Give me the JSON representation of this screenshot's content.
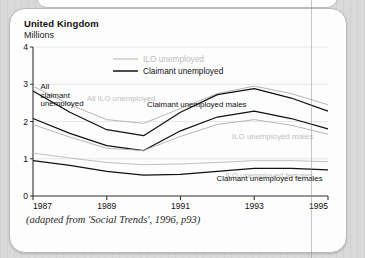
{
  "card": {
    "title": "United Kingdom",
    "units": "Millions",
    "caption": "(adapted from 'Social Trends', 1996, p93)"
  },
  "chart_data": {
    "type": "line",
    "title": "United Kingdom",
    "subtitle": "Millions",
    "xlabel": "",
    "ylabel": "Millions",
    "xlim": [
      1987,
      1995
    ],
    "ylim": [
      0,
      4
    ],
    "yticks": [
      0,
      1,
      2,
      3,
      4
    ],
    "xticks": [
      1987,
      1989,
      1991,
      1993,
      1995
    ],
    "grid": true,
    "grid_axis": "y",
    "legend_position": "top-center",
    "legend": [
      {
        "label": "ILO unemployed",
        "color": "#b8b8b8"
      },
      {
        "label": "Claimant unemployed",
        "color": "#111111"
      }
    ],
    "x": [
      1987,
      1988,
      1989,
      1990,
      1991,
      1992,
      1993,
      1994,
      1995
    ],
    "series": [
      {
        "name": "All ILO unemployed",
        "color": "#b2b2b2",
        "annotation": "All ILO unemployed",
        "values": [
          2.95,
          2.45,
          2.05,
          1.95,
          2.35,
          2.75,
          2.95,
          2.75,
          2.45
        ]
      },
      {
        "name": "All claimant unemployed",
        "color": "#111111",
        "annotation": "All claimant unemployed",
        "values": [
          2.82,
          2.25,
          1.78,
          1.62,
          2.25,
          2.72,
          2.88,
          2.63,
          2.28
        ]
      },
      {
        "name": "Claimant unemployed males",
        "color": "#111111",
        "annotation": "Claimant unemployed males",
        "values": [
          2.08,
          1.68,
          1.35,
          1.22,
          1.75,
          2.12,
          2.28,
          2.08,
          1.8
        ]
      },
      {
        "name": "ILO unemployed males",
        "color": "#b2b2b2",
        "annotation": "ILO unemployed males",
        "values": [
          1.92,
          1.58,
          1.28,
          1.22,
          1.6,
          1.92,
          2.05,
          1.9,
          1.66
        ]
      },
      {
        "name": "ILO unemployed females",
        "color": "#bdbdbd",
        "annotation": "ILO unemployed females",
        "values": [
          1.15,
          1.02,
          0.9,
          0.84,
          0.86,
          0.9,
          0.95,
          0.95,
          0.92
        ]
      },
      {
        "name": "Claimant unemployed females",
        "color": "#111111",
        "annotation": "Claimant unemployed females",
        "values": [
          0.95,
          0.82,
          0.66,
          0.56,
          0.58,
          0.66,
          0.74,
          0.74,
          0.7
        ]
      }
    ]
  }
}
